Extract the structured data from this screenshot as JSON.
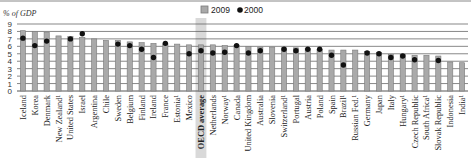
{
  "chart_data": {
    "type": "bar",
    "title": "",
    "ylabel": "% of GDP",
    "xlabel": "",
    "ylim": [
      0,
      9
    ],
    "yticks": [
      0,
      1,
      2,
      3,
      4,
      5,
      6,
      7,
      8,
      9
    ],
    "grid": true,
    "legend_position": "top-center",
    "highlight_category": "OECD average",
    "colors": {
      "bar": "#a9a9a9",
      "bar_border": "#7a7a7a",
      "dot": "#111111",
      "highlight": "#d9d9d9",
      "grid": "#555555"
    },
    "categories": [
      "Iceland",
      "Korea",
      "Denmark",
      "New Zealand¹",
      "United States",
      "Israel",
      "Argentina",
      "Chile",
      "Sweden",
      "Belgium",
      "Finland",
      "Ireland",
      "France",
      "Estonia¹",
      "Mexico",
      "OECD average",
      "Netherlands",
      "Norway¹",
      "Canada",
      "United Kingdom",
      "Australia",
      "Slovenia",
      "Switzerland¹",
      "Portugal",
      "Austria",
      "Poland",
      "Spain",
      "Brazil¹",
      "Russian Fed.¹",
      "Germany",
      "Japan",
      "Italy",
      "Hungary¹",
      "Czech Republic",
      "South Africa¹",
      "Slovak Republic",
      "Indonesia",
      "India¹"
    ],
    "series": [
      {
        "name": "2009",
        "kind": "bar",
        "values": [
          8.1,
          8.0,
          7.9,
          7.4,
          7.3,
          7.2,
          7.0,
          6.8,
          6.8,
          6.6,
          6.5,
          6.4,
          6.3,
          6.3,
          6.2,
          6.2,
          6.2,
          6.1,
          6.1,
          6.0,
          5.9,
          5.9,
          5.8,
          5.8,
          5.7,
          5.6,
          5.5,
          5.5,
          5.5,
          5.3,
          5.2,
          4.9,
          4.9,
          4.8,
          4.8,
          4.7,
          3.9,
          3.8
        ]
      },
      {
        "name": "2000",
        "kind": "dot",
        "values": [
          7.1,
          6.1,
          6.7,
          null,
          7.0,
          7.7,
          null,
          null,
          6.3,
          6.1,
          5.6,
          4.5,
          6.4,
          null,
          5.0,
          5.4,
          5.1,
          5.2,
          6.1,
          5.1,
          5.4,
          null,
          5.6,
          5.4,
          5.6,
          5.6,
          4.8,
          3.5,
          null,
          5.1,
          5.0,
          4.5,
          4.7,
          4.2,
          null,
          4.1,
          null,
          null
        ]
      }
    ]
  }
}
